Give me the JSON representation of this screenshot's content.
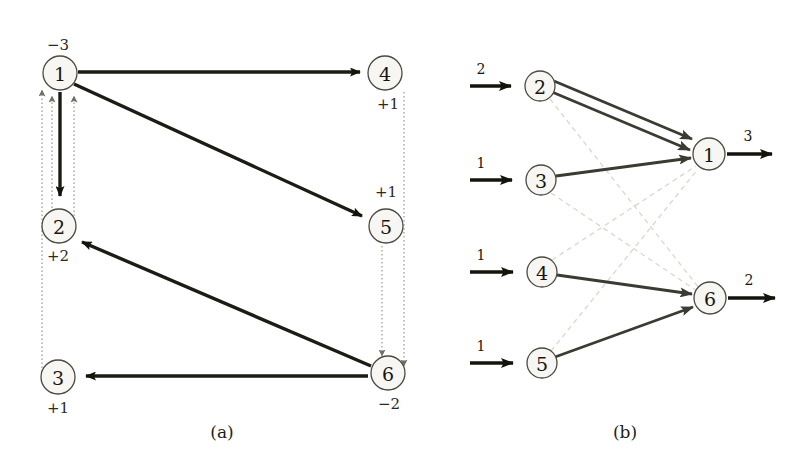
{
  "figure": {
    "background_color": "#ffffff",
    "ink_color": "#1c1c14",
    "dotted_color": "#9d9d92",
    "faint_color": "#d8d8cd"
  },
  "panel_a": {
    "caption": "(a)",
    "nodes": [
      {
        "id": "n1",
        "label": "1",
        "supply": "−3",
        "x": 60,
        "y": 73,
        "r": 17,
        "supply_x": 58,
        "supply_y": 45
      },
      {
        "id": "n4",
        "label": "4",
        "supply": "+1",
        "x": 385,
        "y": 73,
        "r": 17,
        "supply_x": 388,
        "supply_y": 104
      },
      {
        "id": "n2",
        "label": "2",
        "supply": "+2",
        "x": 59,
        "y": 226,
        "r": 17,
        "supply_x": 58,
        "supply_y": 256
      },
      {
        "id": "n5",
        "label": "5",
        "supply": "+1",
        "x": 386,
        "y": 226,
        "r": 17,
        "supply_x": 386,
        "supply_y": 192
      },
      {
        "id": "n3",
        "label": "3",
        "supply": "+1",
        "x": 58,
        "y": 377,
        "r": 17,
        "supply_x": 58,
        "supply_y": 408
      },
      {
        "id": "n6",
        "label": "6",
        "supply": "−2",
        "x": 388,
        "y": 373,
        "r": 17,
        "supply_x": 389,
        "supply_y": 404
      }
    ],
    "solid_edges": [
      {
        "from": "1",
        "to": "4",
        "style": "solid"
      },
      {
        "from": "1",
        "to": "5",
        "style": "solid"
      },
      {
        "from": "1",
        "to": "2",
        "style": "solid"
      },
      {
        "from": "6",
        "to": "2",
        "style": "solid"
      },
      {
        "from": "6",
        "to": "3",
        "style": "solid"
      }
    ],
    "dotted_edges": [
      {
        "from": "2",
        "to": "1",
        "style": "dotted"
      },
      {
        "from": "3",
        "to": "1",
        "style": "dotted"
      },
      {
        "from": "2",
        "to": "1",
        "style": "dotted"
      },
      {
        "from": "4",
        "to": "6",
        "style": "dotted"
      },
      {
        "from": "5",
        "to": "6",
        "style": "dotted"
      }
    ]
  },
  "panel_b": {
    "caption": "(b)",
    "nodes": [
      {
        "id": "b2",
        "label": "2",
        "x": 540,
        "y": 86,
        "r": 15
      },
      {
        "id": "b3",
        "label": "3",
        "x": 541,
        "y": 180,
        "r": 15
      },
      {
        "id": "b4",
        "label": "4",
        "x": 542,
        "y": 272,
        "r": 15
      },
      {
        "id": "b5",
        "label": "5",
        "x": 542,
        "y": 363,
        "r": 15
      },
      {
        "id": "b1",
        "label": "1",
        "x": 709,
        "y": 154,
        "r": 16
      },
      {
        "id": "b6",
        "label": "6",
        "x": 710,
        "y": 298,
        "r": 16
      }
    ],
    "inputs": [
      {
        "node": "2",
        "value": "2",
        "x_start": 470,
        "x_end": 522,
        "y": 86,
        "label_x": 481,
        "label_y": 71
      },
      {
        "node": "3",
        "value": "1",
        "x_start": 470,
        "x_end": 523,
        "y": 180,
        "label_x": 481,
        "label_y": 165
      },
      {
        "node": "4",
        "value": "1",
        "x_start": 470,
        "x_end": 524,
        "y": 272,
        "label_x": 481,
        "label_y": 257
      },
      {
        "node": "5",
        "value": "1",
        "x_start": 470,
        "x_end": 524,
        "y": 363,
        "label_x": 481,
        "label_y": 348
      }
    ],
    "outputs": [
      {
        "node": "1",
        "value": "3",
        "x_start": 727,
        "x_end": 783,
        "y": 154,
        "label_x": 748,
        "label_y": 137
      },
      {
        "node": "6",
        "value": "2",
        "x_start": 728,
        "x_end": 786,
        "y": 298,
        "label_x": 749,
        "label_y": 281
      }
    ],
    "solid_edges": [
      {
        "from": "2",
        "to": "1",
        "variant": "upper"
      },
      {
        "from": "2",
        "to": "1",
        "variant": "lower"
      },
      {
        "from": "3",
        "to": "1",
        "variant": "single"
      },
      {
        "from": "4",
        "to": "6",
        "variant": "single"
      },
      {
        "from": "5",
        "to": "6",
        "variant": "single"
      }
    ],
    "dashed_edges": [
      {
        "from": "2",
        "to": "6"
      },
      {
        "from": "3",
        "to": "6"
      },
      {
        "from": "4",
        "to": "1"
      },
      {
        "from": "5",
        "to": "1"
      }
    ]
  }
}
